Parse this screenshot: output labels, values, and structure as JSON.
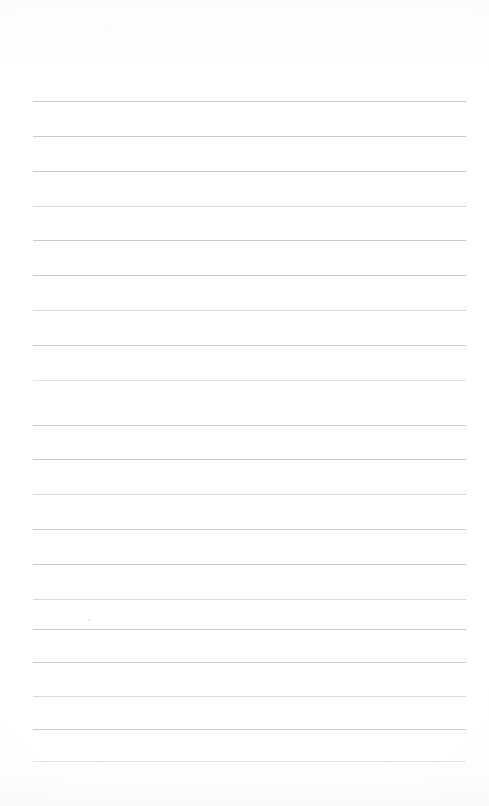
{
  "document": {
    "kind": "scanned-ruled-notepad-page",
    "title": "Blank Ruled Notepad Page",
    "page_width": 489,
    "page_height": 806,
    "background_color": "#fefefe",
    "text_content": "",
    "has_handwriting": false,
    "has_printed_text": false,
    "orientation": "portrait"
  },
  "ruling": {
    "line_color": "#b9bcc2",
    "line_thickness": 1,
    "line_count": 20,
    "left_margin_x": 33,
    "right_margin_x": 466,
    "line_length": 433,
    "first_line_y": 101,
    "last_line_y": 761,
    "line_spacing": 34.7,
    "lines": [
      {
        "index": 1,
        "y": 101,
        "weight": "normal"
      },
      {
        "index": 2,
        "y": 136,
        "weight": "normal"
      },
      {
        "index": 3,
        "y": 171,
        "weight": "normal"
      },
      {
        "index": 4,
        "y": 206,
        "weight": "faint"
      },
      {
        "index": 5,
        "y": 240,
        "weight": "normal"
      },
      {
        "index": 6,
        "y": 275,
        "weight": "normal"
      },
      {
        "index": 7,
        "y": 310,
        "weight": "faint"
      },
      {
        "index": 8,
        "y": 345,
        "weight": "normal"
      },
      {
        "index": 9,
        "y": 380,
        "weight": "fainter"
      },
      {
        "index": 10,
        "y": 425,
        "weight": "normal"
      },
      {
        "index": 11,
        "y": 459,
        "weight": "normal"
      },
      {
        "index": 12,
        "y": 494,
        "weight": "faint"
      },
      {
        "index": 13,
        "y": 529,
        "weight": "normal"
      },
      {
        "index": 14,
        "y": 564,
        "weight": "normal"
      },
      {
        "index": 15,
        "y": 599,
        "weight": "faint"
      },
      {
        "index": 16,
        "y": 629,
        "weight": "normal"
      },
      {
        "index": 17,
        "y": 662,
        "weight": "normal"
      },
      {
        "index": 18,
        "y": 696,
        "weight": "faint"
      },
      {
        "index": 19,
        "y": 729,
        "weight": "normal"
      },
      {
        "index": 20,
        "y": 761,
        "weight": "fainter"
      }
    ]
  },
  "artifacts": {
    "specks": [
      {
        "name": "ink-speck",
        "x": 88,
        "y": 619,
        "size": "normal"
      },
      {
        "name": "scan-speck",
        "x": 232,
        "y": 35,
        "size": "tiny"
      },
      {
        "name": "scan-speck",
        "x": 104,
        "y": 31,
        "size": "tiny"
      },
      {
        "name": "scan-speck",
        "x": 405,
        "y": 20,
        "size": "tiny"
      },
      {
        "name": "scan-speck",
        "x": 452,
        "y": 24,
        "size": "tiny"
      },
      {
        "name": "scan-speck",
        "x": 28,
        "y": 778,
        "size": "tiny"
      },
      {
        "name": "scan-speck",
        "x": 310,
        "y": 790,
        "size": "tiny"
      }
    ]
  }
}
